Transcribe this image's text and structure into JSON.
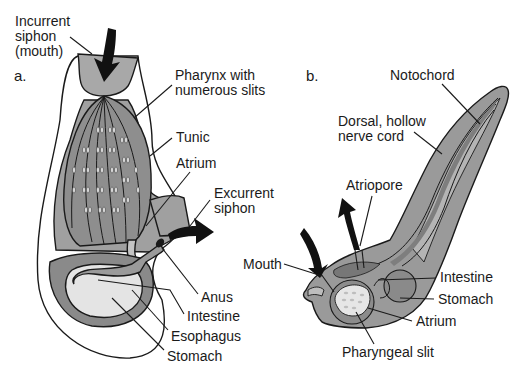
{
  "figure": {
    "panel_a": {
      "letter": "a.",
      "labels": {
        "incurrent_1": "Incurrent",
        "incurrent_2": "siphon",
        "incurrent_3": "(mouth)",
        "pharynx_1": "Pharynx with",
        "pharynx_2": "numerous slits",
        "tunic": "Tunic",
        "atrium": "Atrium",
        "excurrent_1": "Excurrent",
        "excurrent_2": "siphon",
        "anus": "Anus",
        "intestine": "Intestine",
        "esophagus": "Esophagus",
        "stomach": "Stomach"
      }
    },
    "panel_b": {
      "letter": "b.",
      "labels": {
        "notochord": "Notochord",
        "nerve_1": "Dorsal, hollow",
        "nerve_2": "nerve cord",
        "atriopore": "Atriopore",
        "mouth": "Mouth",
        "intestine": "Intestine",
        "stomach": "Stomach",
        "atrium": "Atrium",
        "pharyngeal_slit": "Pharyngeal slit"
      }
    },
    "colors": {
      "dark_gray": "#7a7a7a",
      "mid_gray": "#9c9c9c",
      "light_gray": "#c8c8c8",
      "pale_gray": "#e2e2e2",
      "arrow": "#111111"
    }
  }
}
